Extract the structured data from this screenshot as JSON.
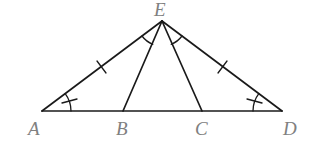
{
  "diagram": {
    "type": "geometry-figure",
    "stroke_color": "#1a1a1a",
    "label_color": "#808080",
    "points": {
      "A": {
        "label": "A",
        "x": 42,
        "y": 111
      },
      "B": {
        "label": "B",
        "x": 123,
        "y": 111
      },
      "C": {
        "label": "C",
        "x": 202,
        "y": 111
      },
      "D": {
        "label": "D",
        "x": 282,
        "y": 111
      },
      "E": {
        "label": "E",
        "x": 162,
        "y": 21
      }
    },
    "segments": [
      "AD",
      "AE",
      "DE",
      "BE",
      "CE"
    ],
    "equal_length_marks": [
      "AE",
      "DE"
    ],
    "equal_angle_marks": [
      {
        "angle": "EAB",
        "type": "arc-with-tick"
      },
      {
        "angle": "EDC",
        "type": "arc-with-tick"
      },
      {
        "angle": "AEB",
        "type": "arc"
      },
      {
        "angle": "CED",
        "type": "arc"
      }
    ]
  }
}
